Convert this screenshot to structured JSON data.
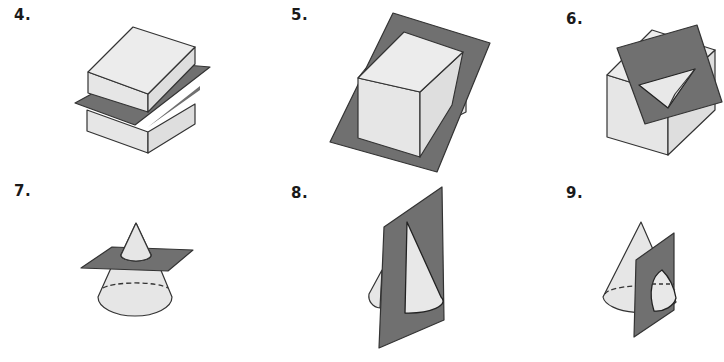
{
  "figures": [
    {
      "number": "4.",
      "solid": "rectangular prism",
      "plane": "horizontal plane",
      "cross_section": "rectangle"
    },
    {
      "number": "5.",
      "solid": "rectangular prism",
      "plane": "tilted plane",
      "cross_section": "rectangle"
    },
    {
      "number": "6.",
      "solid": "cube",
      "plane": "tilted plane through corner",
      "cross_section": "triangle"
    },
    {
      "number": "7.",
      "solid": "cone",
      "plane": "horizontal plane",
      "cross_section": "circle"
    },
    {
      "number": "8.",
      "solid": "cone",
      "plane": "vertical plane through apex",
      "cross_section": "triangle"
    },
    {
      "number": "9.",
      "solid": "cone",
      "plane": "vertical plane not through apex",
      "cross_section": "hyperbola"
    }
  ],
  "colors": {
    "solid_fill": "#e6e6e6",
    "plane_fill": "#707070",
    "outline": "#333333"
  }
}
